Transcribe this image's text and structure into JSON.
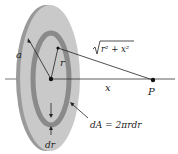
{
  "diagram": {
    "labels": {
      "radius_a": "a",
      "radius_r": "r",
      "distance_sqrt": "√(r² + x²)",
      "sqrt_radicand": "r² + x²",
      "axis_x": "x",
      "point": "P",
      "area_element": "dA = 2πrdr",
      "ring_width": "dr"
    },
    "colors": {
      "disk_face": "#c8c8c8",
      "disk_rim": "#9a9a9a",
      "ring": "#8a8a8a",
      "lines": "#222222"
    }
  }
}
